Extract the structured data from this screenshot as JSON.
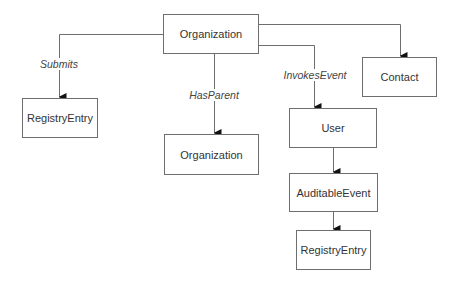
{
  "diagram": {
    "nodes": [
      {
        "id": "org_root",
        "label": "Organization"
      },
      {
        "id": "registry_left",
        "label": "RegistryEntry"
      },
      {
        "id": "org_parent",
        "label": "Organization"
      },
      {
        "id": "contact",
        "label": "Contact"
      },
      {
        "id": "user",
        "label": "User"
      },
      {
        "id": "auditable_event",
        "label": "AuditableEvent"
      },
      {
        "id": "registry_bottom",
        "label": "RegistryEntry"
      }
    ],
    "edges": [
      {
        "from": "org_root",
        "to": "registry_left",
        "label": "Submits"
      },
      {
        "from": "org_root",
        "to": "org_parent",
        "label": "HasParent"
      },
      {
        "from": "org_root",
        "to": "user",
        "label": "InvokesEvent"
      },
      {
        "from": "org_root",
        "to": "contact",
        "label": ""
      },
      {
        "from": "user",
        "to": "auditable_event",
        "label": ""
      },
      {
        "from": "auditable_event",
        "to": "registry_bottom",
        "label": ""
      }
    ]
  }
}
